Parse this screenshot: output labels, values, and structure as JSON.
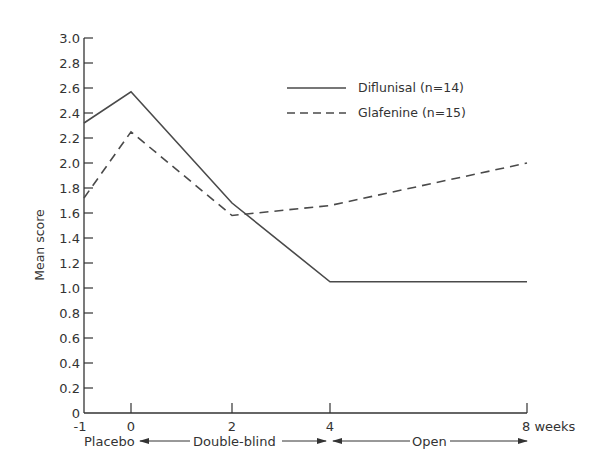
{
  "chart_data": {
    "type": "line",
    "title": "",
    "xlabel": "weeks",
    "ylabel": "Mean score",
    "x": [
      -1,
      0,
      2,
      4,
      8
    ],
    "x_tick_labels": [
      "-1",
      "0",
      "2",
      "4",
      "8 weeks"
    ],
    "y_tick_labels": [
      "0",
      "0.2",
      "0.4",
      "0.6",
      "0.8",
      "1.0",
      "1.2",
      "1.4",
      "1.6",
      "1.8",
      "2.0",
      "2.2",
      "2.4",
      "2.6",
      "2.8",
      "3.0"
    ],
    "ylim": [
      0,
      3.0
    ],
    "xlim": [
      -1,
      8
    ],
    "grid": false,
    "legend_position": "upper right",
    "series": [
      {
        "name": "Diflunisal (n=14)",
        "style": "solid",
        "values": [
          2.32,
          2.57,
          1.68,
          1.05,
          1.05
        ]
      },
      {
        "name": "Glafenine (n=15)",
        "style": "dashed",
        "values": [
          1.72,
          2.25,
          1.58,
          1.66,
          2.0
        ]
      }
    ],
    "annotations": {
      "phases": [
        {
          "label": "Placebo",
          "from": -1,
          "to": 0
        },
        {
          "label": "Double-blind",
          "from": 0,
          "to": 4
        },
        {
          "label": "Open",
          "from": 4,
          "to": 8
        }
      ]
    }
  },
  "legend": {
    "items": [
      {
        "label": "Diflunisal (n=14)"
      },
      {
        "label": "Glafenine (n=15)"
      }
    ]
  },
  "axes": {
    "y_title": "Mean score",
    "x_ticks": [
      "-1",
      "0",
      "2",
      "4",
      "8"
    ],
    "x_unit": "weeks"
  },
  "phases": {
    "placebo": "Placebo",
    "double_blind": "Double-blind",
    "open": "Open"
  },
  "colors": {
    "line": "#4a4a4a",
    "text": "#333333",
    "background": "#ffffff"
  }
}
